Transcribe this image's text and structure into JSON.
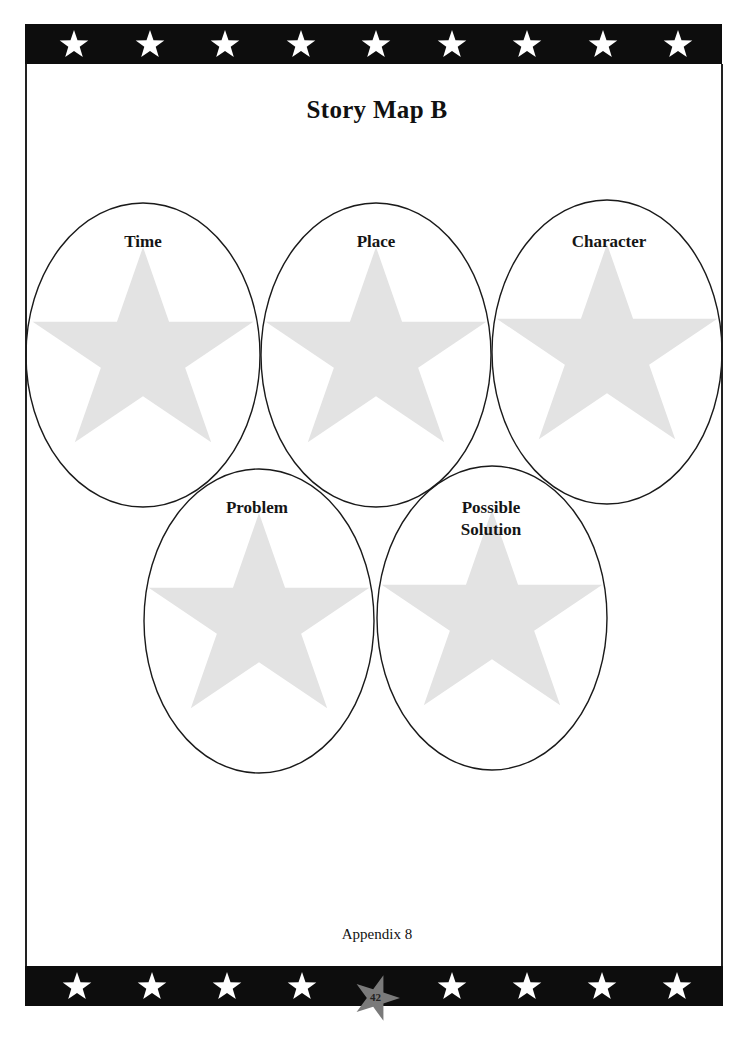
{
  "page": {
    "title": "Story Map B",
    "footer": "Appendix 8",
    "page_number": "42"
  },
  "ovals": [
    {
      "id": "time",
      "label": "Time"
    },
    {
      "id": "place",
      "label": "Place"
    },
    {
      "id": "character",
      "label": "Character"
    },
    {
      "id": "problem",
      "label": "Problem"
    },
    {
      "id": "possible-solution",
      "label_line1": "Possible",
      "label_line2": "Solution"
    }
  ],
  "colors": {
    "bar": "#0d0d0d",
    "bar_star": "#ffffff",
    "oval_star": "#e3e3e3",
    "page_star": "#7a7a7a",
    "outline": "#1a1a1a"
  },
  "decor": {
    "top_bar_stars": 9,
    "bottom_bar_stars": 8
  }
}
